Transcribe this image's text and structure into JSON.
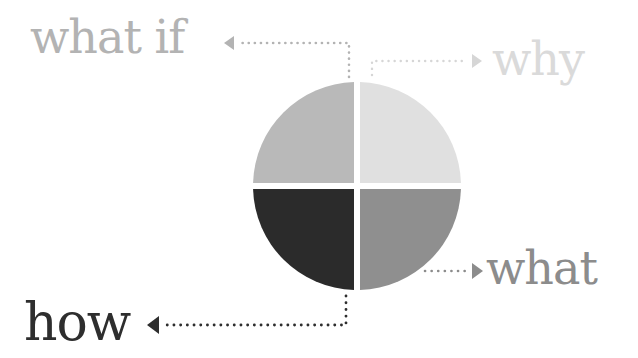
{
  "diagram": {
    "type": "quadrant-circle",
    "quadrants": [
      {
        "position": "top-left",
        "label": "what if",
        "color": "#b9b9b9",
        "label_color": "#b3b3b3"
      },
      {
        "position": "top-right",
        "label": "why",
        "color": "#e0e0e0",
        "label_color": "#dadada"
      },
      {
        "position": "bottom-left",
        "label": "how",
        "color": "#2b2b2b",
        "label_color": "#2e2e2e"
      },
      {
        "position": "bottom-right",
        "label": "what",
        "color": "#8f8f8f",
        "label_color": "#8c8c8c"
      }
    ]
  }
}
